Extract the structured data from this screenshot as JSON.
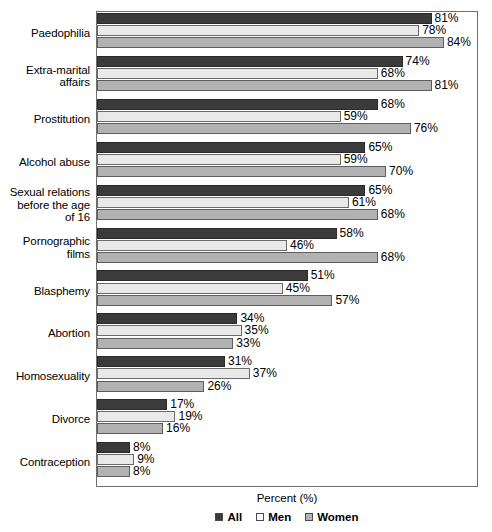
{
  "chart_data": {
    "type": "bar",
    "orientation": "horizontal",
    "title": "",
    "xlabel": "Percent (%)",
    "ylabel": "",
    "xlim": [
      0,
      92
    ],
    "grid": false,
    "legend_position": "bottom",
    "categories": [
      "Paedophilia",
      "Extra-marital affairs",
      "Prostitution",
      "Alcohol abuse",
      "Sexual relations before the age of 16",
      "Pornographic films",
      "Blasphemy",
      "Abortion",
      "Homosexuality",
      "Divorce",
      "Contraception"
    ],
    "series": [
      {
        "name": "All",
        "color": "#3b3b3b",
        "values": [
          81,
          74,
          68,
          65,
          65,
          58,
          51,
          34,
          31,
          17,
          8
        ]
      },
      {
        "name": "Men",
        "color": "#e9e9e9",
        "values": [
          78,
          68,
          59,
          59,
          61,
          46,
          45,
          35,
          37,
          19,
          9
        ]
      },
      {
        "name": "Women",
        "color": "#b2b2b2",
        "values": [
          84,
          81,
          76,
          70,
          68,
          68,
          57,
          33,
          26,
          16,
          8
        ]
      }
    ]
  },
  "axis": {
    "x_title": "Percent (%)"
  },
  "legend": {
    "items": [
      {
        "label": "All",
        "swatch": "all"
      },
      {
        "label": "Men",
        "swatch": "men"
      },
      {
        "label": "Women",
        "swatch": "women"
      }
    ]
  },
  "category_labels": [
    {
      "lines": [
        "Paedophilia"
      ]
    },
    {
      "lines": [
        "Extra-marital",
        "affairs"
      ]
    },
    {
      "lines": [
        "Prostitution"
      ]
    },
    {
      "lines": [
        "Alcohol abuse"
      ]
    },
    {
      "lines": [
        "Sexual relations",
        "before the age",
        "of 16"
      ]
    },
    {
      "lines": [
        "Pornographic",
        "films"
      ]
    },
    {
      "lines": [
        "Blasphemy"
      ]
    },
    {
      "lines": [
        "Abortion"
      ]
    },
    {
      "lines": [
        "Homosexuality"
      ]
    },
    {
      "lines": [
        "Divorce"
      ]
    },
    {
      "lines": [
        "Contraception"
      ]
    }
  ],
  "value_labels": {
    "suffix": "%"
  }
}
